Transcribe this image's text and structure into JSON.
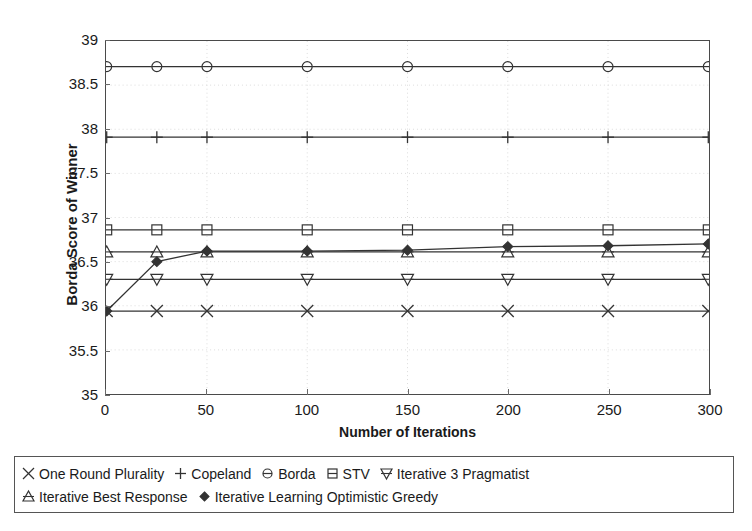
{
  "chart_data": {
    "type": "line",
    "title": "",
    "xlabel": "Number of Iterations",
    "ylabel": "Borda Score of Winner",
    "x": [
      0,
      25,
      50,
      100,
      150,
      200,
      250,
      300
    ],
    "xlim": [
      0,
      300
    ],
    "ylim": [
      35,
      39
    ],
    "xticks": [
      "0",
      "50",
      "100",
      "150",
      "200",
      "250",
      "300"
    ],
    "xtick_values": [
      0,
      50,
      100,
      150,
      200,
      250,
      300
    ],
    "yticks": [
      "35",
      "35.5",
      "36",
      "36.5",
      "37",
      "37.5",
      "38",
      "38.5",
      "39"
    ],
    "ytick_values": [
      35,
      35.5,
      36,
      36.5,
      37,
      37.5,
      38,
      38.5,
      39
    ],
    "grid": true,
    "legend_position": "below-axes",
    "series": [
      {
        "name": "One Round Plurality",
        "marker": "x-cross",
        "filled": false,
        "values": [
          35.94,
          35.94,
          35.94,
          35.94,
          35.94,
          35.94,
          35.94,
          35.94
        ]
      },
      {
        "name": "Copeland",
        "marker": "plus",
        "filled": false,
        "values": [
          37.91,
          37.91,
          37.91,
          37.91,
          37.91,
          37.91,
          37.91,
          37.91
        ]
      },
      {
        "name": "Borda",
        "marker": "circle",
        "filled": false,
        "values": [
          38.71,
          38.71,
          38.71,
          38.71,
          38.71,
          38.71,
          38.71,
          38.71
        ]
      },
      {
        "name": "STV",
        "marker": "square",
        "filled": false,
        "values": [
          36.86,
          36.86,
          36.86,
          36.86,
          36.86,
          36.86,
          36.86,
          36.86
        ]
      },
      {
        "name": "Iterative 3 Pragmatist",
        "marker": "triangle-down",
        "filled": false,
        "values": [
          36.3,
          36.3,
          36.3,
          36.3,
          36.3,
          36.3,
          36.3,
          36.3
        ]
      },
      {
        "name": "Iterative Best Response",
        "marker": "triangle-up",
        "filled": false,
        "values": [
          36.61,
          36.61,
          36.61,
          36.61,
          36.61,
          36.61,
          36.61,
          36.61
        ]
      },
      {
        "name": "Iterative Learning Optimistic Greedy",
        "marker": "diamond",
        "filled": true,
        "values": [
          35.94,
          36.5,
          36.62,
          36.62,
          36.63,
          36.67,
          36.68,
          36.7
        ]
      }
    ]
  },
  "legend": {
    "rows": [
      [
        "One Round Plurality",
        "Copeland",
        "Borda",
        "STV",
        "Iterative 3 Pragmatist"
      ],
      [
        "Iterative Best Response",
        "Iterative Learning Optimistic Greedy"
      ]
    ]
  },
  "colors": {
    "line": "#333333",
    "frame": "#4a4a4a",
    "grid": "#dcdcdc",
    "text": "#1a1a1a",
    "background": "#ffffff"
  }
}
